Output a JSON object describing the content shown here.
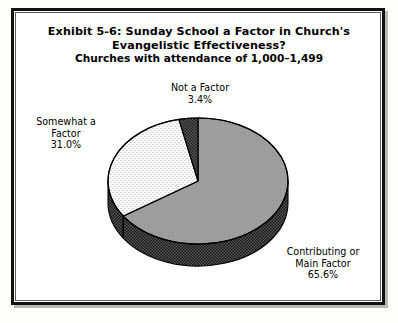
{
  "figure": {
    "title_line_1": "Exhibit 5-6: Sunday School a Factor in Church's",
    "title_line_2": "Evangelistic Effectiveness?",
    "subtitle": "Churches with attendance of 1,000–1,499"
  },
  "chart_data": {
    "type": "pie",
    "title": "Exhibit 5-6: Sunday School a Factor in Church's Evangelistic Effectiveness?",
    "subtitle": "Churches with attendance of 1,000–1,499",
    "three_d": true,
    "start_angle_deg": 0,
    "direction": "clockwise",
    "labels": [
      "Contributing or Main Factor",
      "Somewhat a Factor",
      "Not a Factor"
    ],
    "values": [
      65.6,
      31.0,
      3.4
    ],
    "value_suffix": "%",
    "slices": [
      {
        "name": "Contributing or Main Factor",
        "value": 65.6,
        "display_value": "65.6%",
        "label_lines": [
          "Contributing or",
          "Main Factor",
          "65.6%"
        ],
        "fill": "#9a9a9a",
        "pattern": "solid-gray",
        "side_fill": "#3d3d3d"
      },
      {
        "name": "Somewhat a Factor",
        "value": 31.0,
        "display_value": "31.0%",
        "label_lines": [
          "Somewhat a",
          "Factor",
          "31.0%"
        ],
        "fill": "#f4f4f4",
        "pattern": "fine-dotted",
        "side_fill": "#3d3d3d"
      },
      {
        "name": "Not a Factor",
        "value": 3.4,
        "display_value": "3.4%",
        "label_lines": [
          "Not a Factor",
          "3.4%"
        ],
        "fill": "#4a4a4a",
        "pattern": "checkerboard",
        "side_fill": "#3d3d3d"
      }
    ],
    "legend": "none",
    "labels_position": "outside-callout",
    "grid": false,
    "outline_color": "#000000",
    "background": "#ffffff"
  },
  "colors": {
    "frame": "#111111",
    "frame_inner_rule": "#5d5d5d",
    "page_background": "#ffffff",
    "text": "#000000"
  }
}
